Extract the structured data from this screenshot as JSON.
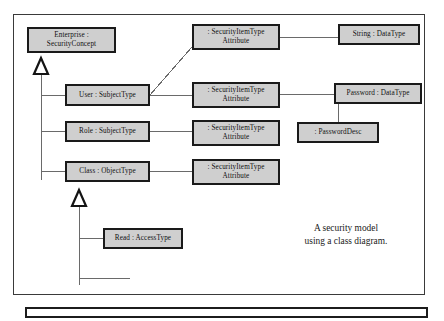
{
  "figure": {
    "caption": "A security model\nusing a class diagram.",
    "background_color": "#ffffff",
    "node_fill_color": "#cfcfcf",
    "node_border_color": "#1a1a1a",
    "line_color": "#4a4a4a",
    "frame_color": "#3a3a3a"
  },
  "diagram": {
    "type": "uml-class-diagram",
    "nodes": [
      {
        "id": "enterprise",
        "label": "Enterprise :\nSecurityConcept",
        "x": 27,
        "y": 27,
        "w": 89,
        "h": 26
      },
      {
        "id": "user",
        "label": "User : SubjectType",
        "x": 65,
        "y": 84,
        "w": 85,
        "h": 22
      },
      {
        "id": "role",
        "label": "Role : SubjectType",
        "x": 65,
        "y": 121,
        "w": 85,
        "h": 21
      },
      {
        "id": "class",
        "label": "Class : ObjectType",
        "x": 65,
        "y": 161,
        "w": 85,
        "h": 21
      },
      {
        "id": "read",
        "label": "Read : AccessType",
        "x": 103,
        "y": 228,
        "w": 80,
        "h": 21
      },
      {
        "id": "attr-top",
        "label": ": SecurityItemType\nAttribute",
        "x": 192,
        "y": 24,
        "w": 88,
        "h": 26
      },
      {
        "id": "attr-mid",
        "label": ": SecurityItemType\nAttribute",
        "x": 192,
        "y": 82,
        "w": 88,
        "h": 26
      },
      {
        "id": "attr-low",
        "label": ": SecurityItemType\nAttribute",
        "x": 192,
        "y": 120,
        "w": 88,
        "h": 26
      },
      {
        "id": "attr-bottom",
        "label": ": SecurityItemType\nAttribute",
        "x": 192,
        "y": 159,
        "w": 88,
        "h": 26
      },
      {
        "id": "string-type",
        "label": "String : DataType",
        "x": 338,
        "y": 24,
        "w": 82,
        "h": 21
      },
      {
        "id": "password-type",
        "label": "Password : DataType",
        "x": 334,
        "y": 83,
        "w": 88,
        "h": 21
      },
      {
        "id": "password-desc",
        "label": ": PasswordDesc",
        "x": 297,
        "y": 122,
        "w": 82,
        "h": 21
      }
    ],
    "edges": [
      {
        "from": "enterprise",
        "to": "user",
        "kind": "generalization"
      },
      {
        "from": "enterprise",
        "to": "role",
        "kind": "generalization"
      },
      {
        "from": "enterprise",
        "to": "class",
        "kind": "generalization"
      },
      {
        "from": "class",
        "to": "read",
        "kind": "generalization"
      },
      {
        "from": "user",
        "to": "attr-top",
        "kind": "association"
      },
      {
        "from": "user",
        "to": "attr-mid",
        "kind": "association"
      },
      {
        "from": "role",
        "to": "attr-low",
        "kind": "association"
      },
      {
        "from": "class",
        "to": "attr-bottom",
        "kind": "association"
      },
      {
        "from": "attr-top",
        "to": "string-type",
        "kind": "association"
      },
      {
        "from": "attr-mid",
        "to": "password-type",
        "kind": "association"
      },
      {
        "from": "attr-mid",
        "to": "password-desc",
        "kind": "association"
      }
    ]
  }
}
